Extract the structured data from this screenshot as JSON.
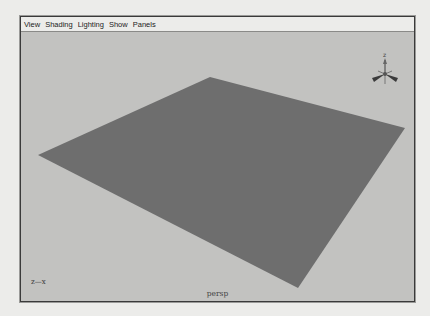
{
  "menubar": {
    "items": [
      {
        "label": "View"
      },
      {
        "label": "Shading"
      },
      {
        "label": "Lighting"
      },
      {
        "label": "Show"
      },
      {
        "label": "Panels"
      }
    ]
  },
  "viewport": {
    "camera_name": "persp",
    "axis_indicator": "z—x",
    "background_color": "#c2c2c0",
    "plane_color": "#6e6e6e",
    "gizmo_icon": "view-axis-gizmo-icon"
  }
}
